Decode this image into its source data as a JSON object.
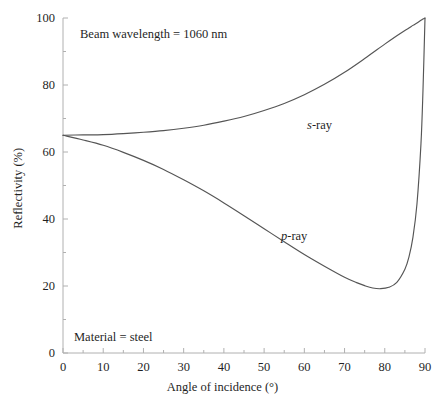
{
  "chart_data": {
    "type": "line",
    "title": "",
    "xlabel": "Angle of incidence (°)",
    "ylabel": "Reflectivity (%)",
    "xlim": [
      0,
      90
    ],
    "ylim": [
      0,
      100
    ],
    "xticks": [
      0,
      10,
      20,
      30,
      40,
      50,
      60,
      70,
      80,
      90
    ],
    "yticks": [
      0,
      20,
      40,
      60,
      80,
      100
    ],
    "xtick_labels": [
      "0",
      "10",
      "20",
      "30",
      "40",
      "50",
      "60",
      "70",
      "80",
      "90"
    ],
    "ytick_labels": [
      "0",
      "20",
      "40",
      "60",
      "80",
      "100"
    ],
    "grid": false,
    "legend": "inline-curve-labels",
    "annotations": [
      {
        "text": "Beam wavelength = 1060 nm",
        "x": 7,
        "y": 96
      },
      {
        "text": "Material = steel",
        "x": 3,
        "y": 7
      }
    ],
    "series": [
      {
        "name": "s-ray",
        "label_italic_prefix": "s",
        "label_rest": "-ray",
        "color": "#555555",
        "x": [
          0,
          5,
          10,
          15,
          20,
          25,
          30,
          35,
          40,
          45,
          50,
          55,
          60,
          65,
          70,
          75,
          80,
          83,
          85,
          86,
          87,
          88,
          89,
          89.5,
          90
        ],
        "y": [
          65.0,
          65.1,
          65.2,
          65.5,
          65.9,
          66.4,
          67.1,
          68.0,
          69.2,
          70.6,
          72.4,
          74.5,
          77.1,
          80.2,
          83.8,
          87.9,
          92.2,
          94.7,
          96.3,
          97.0,
          97.8,
          98.5,
          99.3,
          99.7,
          100.0
        ]
      },
      {
        "name": "p-ray",
        "label_italic_prefix": "p",
        "label_rest": "-ray",
        "color": "#555555",
        "x": [
          0,
          5,
          10,
          15,
          20,
          25,
          30,
          35,
          40,
          45,
          50,
          55,
          60,
          65,
          70,
          73,
          75,
          77,
          79,
          81,
          83,
          85,
          86,
          87,
          88,
          89,
          89.5,
          90
        ],
        "y": [
          65.0,
          63.6,
          62.0,
          59.9,
          57.5,
          54.8,
          51.7,
          48.4,
          44.8,
          41.0,
          37.1,
          33.2,
          29.4,
          25.9,
          22.6,
          21.0,
          20.1,
          19.4,
          19.2,
          19.6,
          21.1,
          25.0,
          28.6,
          34.5,
          44.5,
          62.5,
          78.5,
          100.0
        ]
      }
    ]
  },
  "axes_geometry": {
    "plot_left": 63,
    "plot_right": 425,
    "plot_top": 18,
    "plot_bottom": 353
  },
  "colors": {
    "axis": "#b0b0b0",
    "curve": "#555555",
    "text": "#1f1f1f",
    "background": "#ffffff"
  },
  "labels": {
    "s_ray_italic": "s",
    "s_ray_rest": "-ray",
    "p_ray_italic": "p",
    "p_ray_rest": "-ray",
    "wavelength_note": "Beam wavelength = 1060 nm",
    "material_note": "Material = steel",
    "x_axis_title": "Angle of incidence (°)",
    "y_axis_title": "Reflectivity (%)"
  }
}
